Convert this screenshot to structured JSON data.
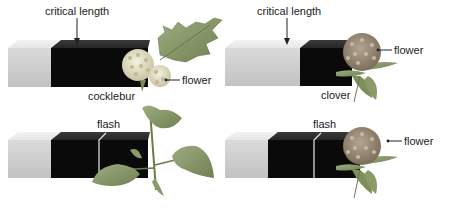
{
  "figure": {
    "panels": [
      {
        "id": "cocklebur-critical",
        "plant": "cocklebur",
        "top_label": "critical length",
        "plant_label": "cocklebur",
        "flower_label": "flower",
        "flowering": true
      },
      {
        "id": "clover-critical",
        "plant": "clover",
        "top_label": "critical length",
        "plant_label": "clover",
        "flower_label": "flower",
        "flowering": true
      },
      {
        "id": "cocklebur-flash",
        "plant": "cocklebur",
        "top_label": "flash",
        "flowering": false
      },
      {
        "id": "clover-flash",
        "plant": "clover",
        "top_label": "flash",
        "flower_label": "flower",
        "flowering": true
      }
    ],
    "colors": {
      "light_period": "#d4d4d4",
      "dark_period": "#0a0a0a",
      "leaf": "#8a9a6a",
      "cocklebur_flower": "#e6e2c8",
      "clover_flower": "#9a8a78"
    }
  }
}
